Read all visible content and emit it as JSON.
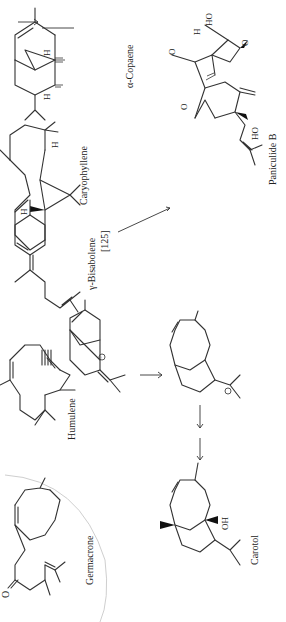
{
  "diagram": {
    "type": "chemical-reaction-scheme",
    "orientation": "rotated-90-ccw",
    "compounds": [
      {
        "id": "germacrone",
        "label": "Germacrone"
      },
      {
        "id": "humulene",
        "label": "Humulene"
      },
      {
        "id": "carbocation",
        "label": ""
      },
      {
        "id": "bisabolene",
        "label": "γ-Bisabolene",
        "ref": "[125]"
      },
      {
        "id": "caryophyllene",
        "label": "Caryophyllene"
      },
      {
        "id": "copaene",
        "label": "α-Copaene"
      },
      {
        "id": "paniculide",
        "label": "Paniculide B"
      },
      {
        "id": "intermediate",
        "label": ""
      },
      {
        "id": "carotol",
        "label": "Carotol"
      }
    ],
    "atom_labels": {
      "oxygen": "O",
      "hydrogen": "H",
      "hydroxyl": "OH",
      "hydroxyl_rev": "HO",
      "cation": "⊕"
    },
    "equivalence_symbol": "≡",
    "arrows": [
      {
        "from": "caryophyllene",
        "to": "copaene"
      },
      {
        "from": "carbocation",
        "to": "intermediate"
      },
      {
        "from": "intermediate",
        "to": "carotol"
      },
      {
        "from": "bisabolene",
        "to": "paniculide"
      }
    ]
  }
}
